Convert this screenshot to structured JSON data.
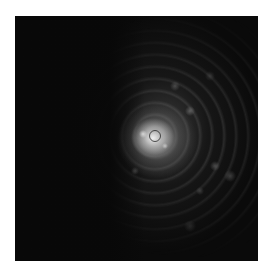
{
  "image": {
    "description": "Grayscale speckle / diffraction-like intensity pattern on a black square, bright core slightly left of center with concentric rings spreading to the right",
    "background_color": "#ffffff",
    "frame_color": "#0a0a0a",
    "core_color": "#f5f5f5"
  }
}
